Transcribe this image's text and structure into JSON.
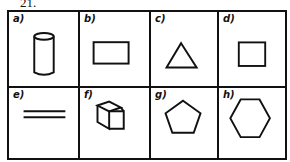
{
  "question_number": "21.",
  "cells": [
    {
      "label": "a)",
      "shape": "cylinder-icon"
    },
    {
      "label": "b)",
      "shape": "rectangle-icon"
    },
    {
      "label": "c)",
      "shape": "triangle-icon"
    },
    {
      "label": "d)",
      "shape": "square-icon"
    },
    {
      "label": "e)",
      "shape": "parallel-lines-icon"
    },
    {
      "label": "f)",
      "shape": "cube-icon"
    },
    {
      "label": "g)",
      "shape": "pentagon-icon"
    },
    {
      "label": "h)",
      "shape": "hexagon-icon"
    }
  ],
  "colors": {
    "ink": "#111111",
    "paper": "#ffffff"
  }
}
